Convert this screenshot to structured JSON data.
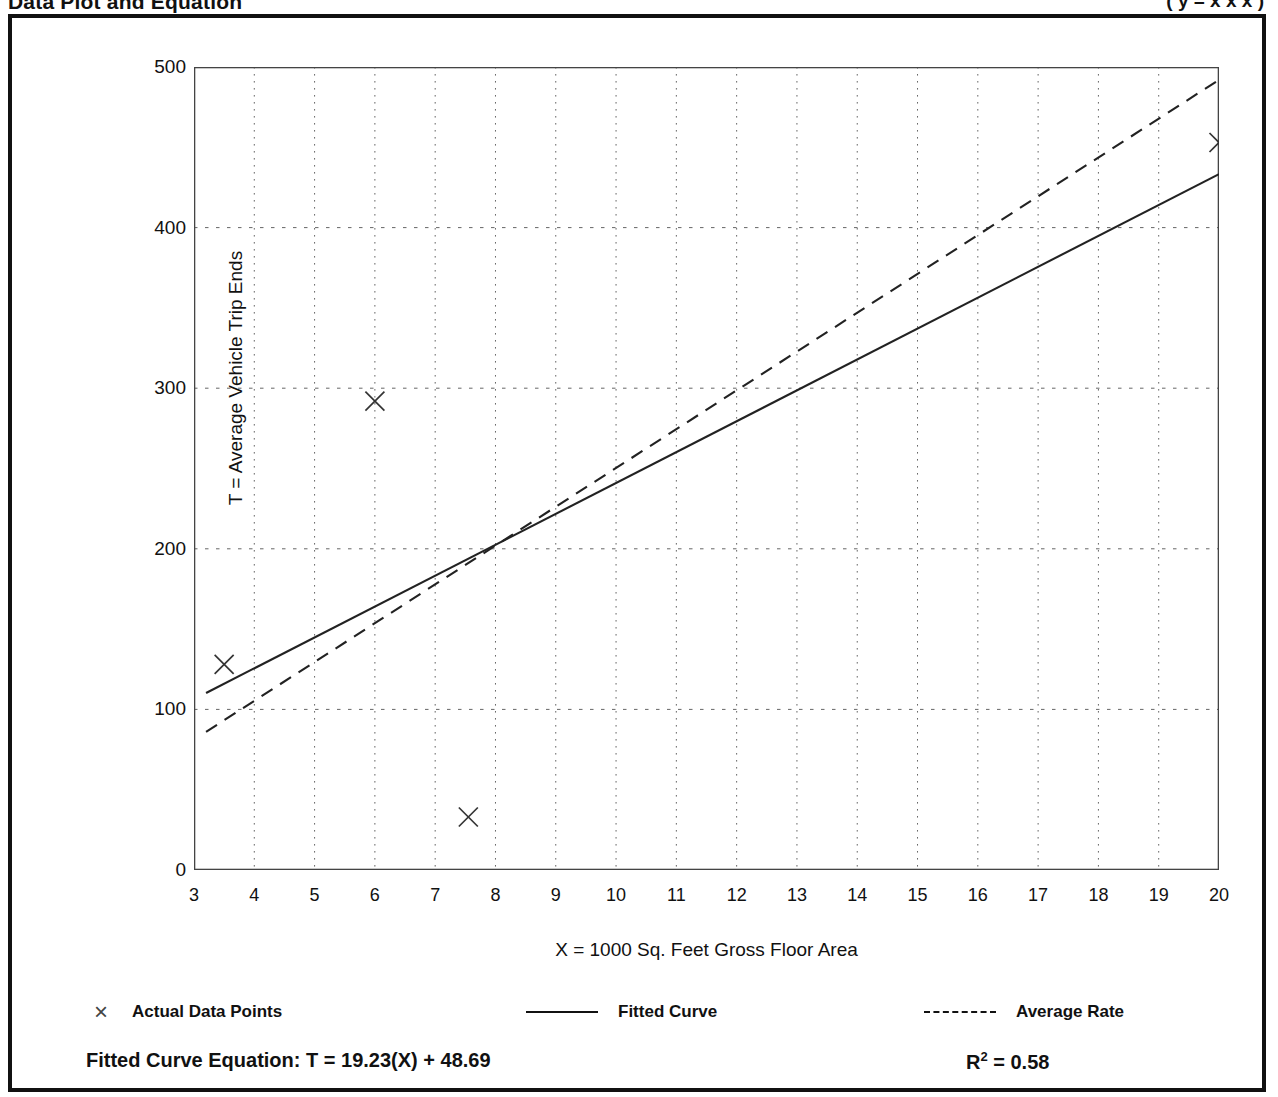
{
  "page": {
    "title": "Data Plot and Equation",
    "title_right": "( y = x x x )"
  },
  "legend": {
    "items": [
      {
        "label": "Actual Data Points",
        "style": "marker",
        "glyph": "×"
      },
      {
        "label": "Fitted Curve",
        "style": "solid"
      },
      {
        "label": "Average Rate",
        "style": "dashed"
      }
    ]
  },
  "equation": {
    "fitted_label": "Fitted Curve Equation:  T = 19.23(X) + 48.69",
    "r2_prefix": "R",
    "r2_exp": "2",
    "r2_value": " = 0.58"
  },
  "chart_data": {
    "type": "scatter",
    "title": "Data Plot and Equation",
    "xlabel": "X = 1000 Sq. Feet Gross Floor Area",
    "ylabel": "T = Average Vehicle Trip Ends",
    "xlim": [
      3,
      20
    ],
    "ylim": [
      0,
      500
    ],
    "xticks": [
      3,
      4,
      5,
      6,
      7,
      8,
      9,
      10,
      11,
      12,
      13,
      14,
      15,
      16,
      17,
      18,
      19,
      20
    ],
    "xtick_labels": [
      "3",
      "4",
      "5",
      "6",
      "7",
      "8",
      "9",
      "10",
      "11",
      "12",
      "13",
      "14",
      "15",
      "16",
      "17",
      "18",
      "19",
      "20"
    ],
    "yticks": [
      0,
      100,
      200,
      300,
      400,
      500
    ],
    "ytick_labels": [
      "0",
      "100",
      "200",
      "300",
      "400",
      "500"
    ],
    "y_minor_ticks": [
      50,
      150,
      250,
      350,
      450
    ],
    "grid": true,
    "grid_style": "dotted",
    "legend_position": "below-axes",
    "points": [
      {
        "x": 3.5,
        "y": 128
      },
      {
        "x": 6.0,
        "y": 292
      },
      {
        "x": 7.55,
        "y": 33
      },
      {
        "x": 20.0,
        "y": 453
      }
    ],
    "series": [
      {
        "name": "Fitted Curve",
        "type": "line",
        "style": "solid",
        "equation": "T = 19.23(X) + 48.69",
        "r_squared": 0.58,
        "slope": 19.23,
        "intercept": 48.69,
        "endpoints": [
          {
            "x": 3.2,
            "y": 110.2
          },
          {
            "x": 20.0,
            "y": 433.3
          }
        ]
      },
      {
        "name": "Average Rate",
        "type": "line",
        "style": "dashed",
        "slope": 24.65,
        "intercept": 0,
        "endpoints": [
          {
            "x": 3.2,
            "y": 86.0
          },
          {
            "x": 20.0,
            "y": 492.0
          }
        ]
      }
    ]
  }
}
